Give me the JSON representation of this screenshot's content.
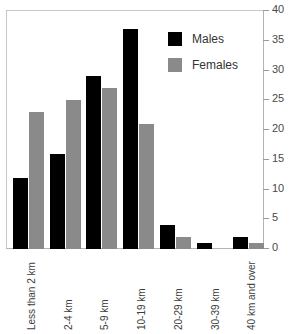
{
  "chart_data": {
    "type": "bar",
    "title": "",
    "subtitle": "",
    "xlabel": "",
    "ylabel": "",
    "ylim": [
      0,
      40
    ],
    "yticks": [
      0,
      5,
      10,
      15,
      20,
      25,
      30,
      35,
      40
    ],
    "grid": false,
    "y_axis_position": "right",
    "x_tick_label_rotation": -90,
    "legend": {
      "position": "top-right",
      "entries": [
        {
          "name": "Males",
          "color": "#000000"
        },
        {
          "name": "Females",
          "color": "#8a8a8a"
        }
      ]
    },
    "categories": [
      "Less than 2 km",
      "2-4 km",
      "5-9 km",
      "10-19 km",
      "20-29 km",
      "30-39 km",
      "40 km and over"
    ],
    "series": [
      {
        "name": "Males",
        "color": "#000000",
        "values": [
          12,
          16,
          29,
          37,
          4,
          1,
          2
        ]
      },
      {
        "name": "Females",
        "color": "#8a8a8a",
        "values": [
          23,
          25,
          27,
          21,
          2,
          0,
          1
        ]
      }
    ]
  },
  "colors": {
    "males": "#000000",
    "females": "#8a8a8a",
    "axis": "#b4b4b4",
    "frame": "#c8c8c8",
    "tick_text": "#4a4a4a",
    "label_text": "#3d3d3d"
  }
}
